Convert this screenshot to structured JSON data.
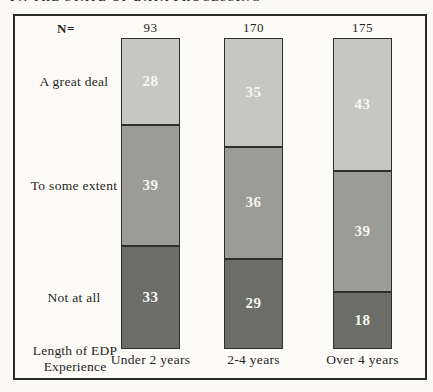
{
  "page": {
    "cropped_caption_fragment": "IV. THE STATE OF DATA PROCESSING"
  },
  "chart_data": {
    "type": "bar",
    "variant": "100-percent-stacked-column",
    "n_label": "N=",
    "n_values": [
      93,
      170,
      175
    ],
    "categories": [
      "Under 2 years",
      "2-4 years",
      "Over 4 years"
    ],
    "series": [
      {
        "name": "A great deal",
        "values": [
          28,
          35,
          43
        ],
        "color": "#c6c6c2"
      },
      {
        "name": "To some extent",
        "values": [
          39,
          36,
          39
        ],
        "color": "#9b9b97"
      },
      {
        "name": "Not at all",
        "values": [
          33,
          29,
          18
        ],
        "color": "#6c6c68"
      }
    ],
    "x_axis_title": "Length of EDP Experience",
    "ylim": [
      0,
      100
    ],
    "value_label_color": "#f6f6f2",
    "frame_border_color": "#2b2b27",
    "legend_position": "left-of-plot-aligned-to-first-bar-segments",
    "grid": false
  }
}
